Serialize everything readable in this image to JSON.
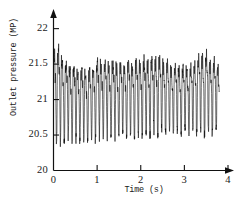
{
  "chart_data": {
    "type": "line",
    "title": "",
    "xlabel": "Time (s)",
    "ylabel": "Outlet pressure (MP)",
    "xlim": [
      0,
      4
    ],
    "ylim": [
      20,
      22.15
    ],
    "xticks": [
      0,
      1,
      2,
      3,
      4
    ],
    "xtick_labels": [
      "0",
      "1",
      "2",
      "3",
      "4"
    ],
    "yticks": [
      20,
      20.5,
      21,
      21.5,
      22
    ],
    "ytick_labels": [
      "20",
      "20.5",
      "21",
      "21.5",
      "22"
    ],
    "grid": false,
    "legend": null,
    "axis_arrows": true,
    "line_color": "#111111",
    "axis_color": "#111111",
    "background_color": "#ffffff",
    "series": [
      {
        "name": "Outlet pressure",
        "mean": 21.05,
        "x_start": 0.0,
        "x_end": 3.8,
        "sample_interval": 0.0025,
        "fundamental_hz": 11.2,
        "harmonics": [
          {
            "hz": 11.2,
            "amp": 0.42,
            "phase": 0.0
          },
          {
            "hz": 22.4,
            "amp": 0.17,
            "phase": 1.1
          },
          {
            "hz": 33.6,
            "amp": 0.085,
            "phase": 2.3
          },
          {
            "hz": 44.8,
            "amp": 0.05,
            "phase": 0.6
          },
          {
            "hz": 5.6,
            "amp": 0.055,
            "phase": 2.9
          },
          {
            "hz": 67.0,
            "amp": 0.028,
            "phase": 1.7
          }
        ],
        "envelope_points": [
          {
            "t": 0.0,
            "top": 22.05,
            "bottom": 20.42
          },
          {
            "t": 0.12,
            "top": 22.02,
            "bottom": 20.35
          },
          {
            "t": 0.3,
            "top": 21.78,
            "bottom": 20.38
          },
          {
            "t": 0.55,
            "top": 21.72,
            "bottom": 20.4
          },
          {
            "t": 0.8,
            "top": 21.66,
            "bottom": 20.37
          },
          {
            "t": 1.05,
            "top": 21.83,
            "bottom": 20.45
          },
          {
            "t": 1.3,
            "top": 21.8,
            "bottom": 20.45
          },
          {
            "t": 1.6,
            "top": 21.76,
            "bottom": 20.47
          },
          {
            "t": 1.9,
            "top": 21.82,
            "bottom": 20.43
          },
          {
            "t": 2.15,
            "top": 21.86,
            "bottom": 20.45
          },
          {
            "t": 2.4,
            "top": 21.88,
            "bottom": 20.47
          },
          {
            "t": 2.65,
            "top": 21.74,
            "bottom": 20.5
          },
          {
            "t": 2.9,
            "top": 21.68,
            "bottom": 20.52
          },
          {
            "t": 3.15,
            "top": 21.72,
            "bottom": 20.5
          },
          {
            "t": 3.4,
            "top": 21.95,
            "bottom": 20.48
          },
          {
            "t": 3.6,
            "top": 21.84,
            "bottom": 20.5
          },
          {
            "t": 3.8,
            "top": 21.7,
            "bottom": 20.52
          }
        ]
      }
    ]
  },
  "axes": {
    "y_title": "Outlet pressure (MP)",
    "x_title": "Time (s)",
    "y_labels": [
      "22",
      "21.5",
      "21",
      "20.5",
      "20"
    ],
    "x_labels": [
      "0",
      "1",
      "2",
      "3",
      "4"
    ]
  }
}
